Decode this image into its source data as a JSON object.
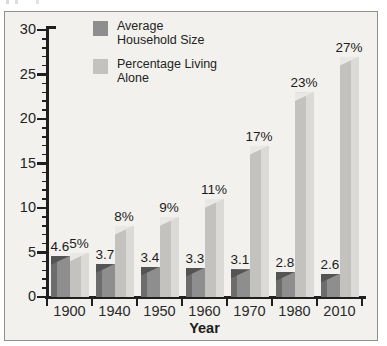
{
  "chart": {
    "legend": [
      {
        "swatch": "dark",
        "lines": [
          "Average",
          "Household Size"
        ]
      },
      {
        "swatch": "light",
        "lines": [
          "Percentage Living",
          "Alone"
        ]
      }
    ]
  },
  "chart_data": {
    "type": "bar",
    "title": "",
    "categories": [
      "1900",
      "1940",
      "1950",
      "1960",
      "1970",
      "1980",
      "2010"
    ],
    "series": [
      {
        "name": "Average Household Size",
        "values": [
          4.6,
          3.7,
          3.4,
          3.3,
          3.1,
          2.8,
          2.6
        ],
        "labels": [
          "4.6",
          "3.7",
          "3.4",
          "3.3",
          "3.1",
          "2.8",
          "2.6"
        ]
      },
      {
        "name": "Percentage Living Alone",
        "values": [
          5,
          8,
          9,
          11,
          17,
          23,
          27
        ],
        "labels": [
          "5%",
          "8%",
          "9%",
          "11%",
          "17%",
          "23%",
          "27%"
        ]
      }
    ],
    "xlabel": "Year",
    "ylabel": "",
    "ylim": [
      0,
      30
    ],
    "ytick_major": 5,
    "ytick_minor": 1,
    "ytick_labels": [
      "0",
      "5",
      "10",
      "15",
      "20",
      "25",
      "30"
    ],
    "grid": false,
    "legend_position": "top-left",
    "data_labels": true
  },
  "colors": {
    "dark_bar": "#8e8e8e",
    "dark_bar_shade": "#6c6c6c",
    "dark_bar_bevel": "#545454",
    "light_bar": "#c3c2bf",
    "light_bar_highlight": "#dbdad6",
    "light_bar_bevel": "#eae8e4",
    "plot_background": "#f2f1ed",
    "frame_border": "#8f8f8f",
    "axis": "#1f1f1f",
    "text": "#232323"
  }
}
